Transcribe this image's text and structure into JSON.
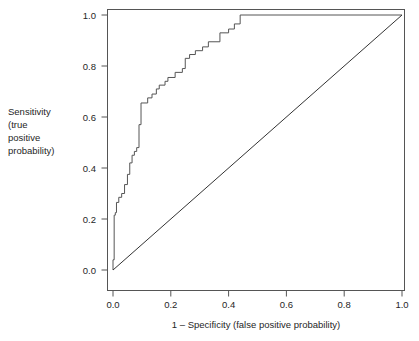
{
  "chart_data": {
    "type": "line",
    "title": "",
    "xlabel": "1 – Specificity (false positive probability)",
    "ylabel_lines": [
      "Sensitivity",
      "(true",
      "positive",
      "probability)"
    ],
    "ylabel": "Sensitivity (true positive probability)",
    "xlim": [
      0.0,
      1.0
    ],
    "ylim": [
      0.0,
      1.0
    ],
    "grid": false,
    "legend": null,
    "xticks": [
      0.0,
      0.2,
      0.4,
      0.6,
      0.8,
      1.0
    ],
    "xticklabels": [
      "0.0",
      "0.2",
      "0.4",
      "0.6",
      "0.8",
      "1.0"
    ],
    "yticks": [
      0.0,
      0.2,
      0.4,
      0.6,
      0.8,
      1.0
    ],
    "yticklabels": [
      "0.0",
      "0.2",
      "0.4",
      "0.6",
      "0.8",
      "1.0"
    ],
    "series": [
      {
        "name": "roc-curve",
        "style": "step",
        "color": "#555555",
        "points": [
          [
            0.0,
            0.0
          ],
          [
            0.0,
            0.04
          ],
          [
            0.004,
            0.04
          ],
          [
            0.004,
            0.215
          ],
          [
            0.008,
            0.215
          ],
          [
            0.008,
            0.225
          ],
          [
            0.012,
            0.225
          ],
          [
            0.012,
            0.265
          ],
          [
            0.02,
            0.265
          ],
          [
            0.02,
            0.285
          ],
          [
            0.03,
            0.285
          ],
          [
            0.03,
            0.3
          ],
          [
            0.04,
            0.3
          ],
          [
            0.04,
            0.335
          ],
          [
            0.05,
            0.335
          ],
          [
            0.05,
            0.375
          ],
          [
            0.058,
            0.375
          ],
          [
            0.058,
            0.42
          ],
          [
            0.066,
            0.42
          ],
          [
            0.066,
            0.45
          ],
          [
            0.074,
            0.45
          ],
          [
            0.074,
            0.465
          ],
          [
            0.082,
            0.465
          ],
          [
            0.082,
            0.48
          ],
          [
            0.09,
            0.48
          ],
          [
            0.09,
            0.57
          ],
          [
            0.097,
            0.57
          ],
          [
            0.097,
            0.655
          ],
          [
            0.12,
            0.655
          ],
          [
            0.12,
            0.675
          ],
          [
            0.135,
            0.675
          ],
          [
            0.135,
            0.69
          ],
          [
            0.15,
            0.69
          ],
          [
            0.15,
            0.71
          ],
          [
            0.16,
            0.71
          ],
          [
            0.16,
            0.725
          ],
          [
            0.18,
            0.725
          ],
          [
            0.18,
            0.74
          ],
          [
            0.19,
            0.74
          ],
          [
            0.19,
            0.755
          ],
          [
            0.215,
            0.755
          ],
          [
            0.215,
            0.775
          ],
          [
            0.24,
            0.775
          ],
          [
            0.24,
            0.79
          ],
          [
            0.25,
            0.79
          ],
          [
            0.25,
            0.83
          ],
          [
            0.265,
            0.83
          ],
          [
            0.265,
            0.845
          ],
          [
            0.285,
            0.845
          ],
          [
            0.285,
            0.86
          ],
          [
            0.31,
            0.86
          ],
          [
            0.31,
            0.875
          ],
          [
            0.33,
            0.875
          ],
          [
            0.33,
            0.895
          ],
          [
            0.37,
            0.895
          ],
          [
            0.37,
            0.93
          ],
          [
            0.4,
            0.93
          ],
          [
            0.4,
            0.945
          ],
          [
            0.42,
            0.945
          ],
          [
            0.42,
            0.965
          ],
          [
            0.44,
            0.965
          ],
          [
            0.44,
            1.0
          ],
          [
            1.0,
            1.0
          ]
        ]
      },
      {
        "name": "reference-diagonal",
        "style": "line",
        "color": "#333333",
        "points": [
          [
            0.0,
            0.0
          ],
          [
            1.0,
            1.0
          ]
        ]
      }
    ]
  },
  "colors": {
    "background": "#ffffff",
    "axis": "#555555",
    "curve": "#555555",
    "diagonal": "#333333",
    "text": "#262626"
  }
}
